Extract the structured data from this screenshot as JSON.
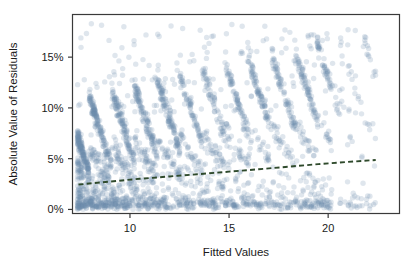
{
  "chart_data": {
    "type": "scatter",
    "title": "",
    "subtitle": "",
    "xlabel": "Fitted Values",
    "ylabel": "Absolute Value of Residuals",
    "xlim": [
      7.1,
      23.6
    ],
    "ylim": [
      -0.004,
      0.192
    ],
    "grid": false,
    "legend": null,
    "xticks": [
      10,
      15,
      20
    ],
    "xtick_labels": [
      "10",
      "15",
      "20"
    ],
    "yticks": [
      0,
      0.05,
      0.1,
      0.15
    ],
    "ytick_labels": [
      "0%",
      "5%",
      "10%",
      "15%"
    ],
    "point_color": "#6d8fae",
    "point_opacity": 0.22,
    "point_radius": 2.7,
    "trend_color": "#2f4a2c",
    "trend_style": "dashed",
    "frame_color": "#3a3a3a",
    "background": "#ffffff",
    "n_points": 2600,
    "series": [
      {
        "name": "Absolute residuals",
        "marker": "circle",
        "color": "#6d8fae",
        "x_range": [
          7.3,
          22.4
        ],
        "y_range": [
          0.0,
          0.188
        ]
      }
    ],
    "trend_line": {
      "name": "Smoothed trend",
      "x": [
        7.4,
        9.0,
        10.5,
        12.0,
        13.5,
        15.0,
        16.5,
        18.0,
        19.5,
        21.0,
        22.4
      ],
      "y": [
        0.0245,
        0.0275,
        0.0302,
        0.0325,
        0.0348,
        0.0372,
        0.0396,
        0.0421,
        0.0446,
        0.0468,
        0.0487
      ]
    },
    "band_structure": {
      "description": "Points fall along repeating downward-then-upward diagonal ridges created by discrete outcome values.",
      "band_count": 13,
      "band_spacing_x": 1.15
    }
  },
  "axes": {
    "x_title": "Fitted Values",
    "y_title": "Absolute Value of Residuals"
  }
}
